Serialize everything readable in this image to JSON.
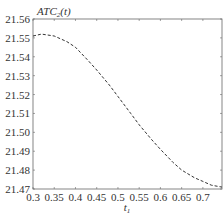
{
  "chart_data": {
    "type": "line",
    "title": "",
    "ylabel": "ATC2(t)",
    "ylabel_main": "ATC",
    "ylabel_sub": "2",
    "ylabel_tail": "(t)",
    "xlabel": "t1",
    "xlabel_main": "t",
    "xlabel_sub": "1",
    "xlim": [
      0.3,
      0.745
    ],
    "ylim": [
      21.47,
      21.56
    ],
    "x_ticks": [
      "0.3",
      "0.35",
      "0.4",
      "0.45",
      "0.5",
      "0.55",
      "0.6",
      "0.65",
      "0.7"
    ],
    "y_ticks": [
      "21.56",
      "21.55",
      "21.54",
      "21.53",
      "21.52",
      "21.51",
      "21.50",
      "21.49",
      "21.48",
      "21.47"
    ],
    "grid": false,
    "line_style": "dashed",
    "series": [
      {
        "name": "ATC2(t)",
        "x": [
          0.3,
          0.32,
          0.35,
          0.38,
          0.4,
          0.43,
          0.45,
          0.48,
          0.5,
          0.53,
          0.55,
          0.58,
          0.6,
          0.63,
          0.65,
          0.68,
          0.7,
          0.72,
          0.745
        ],
        "values": [
          21.551,
          21.552,
          21.551,
          21.548,
          21.545,
          21.538,
          21.533,
          21.525,
          21.519,
          21.51,
          21.504,
          21.496,
          21.491,
          21.484,
          21.48,
          21.476,
          21.474,
          21.472,
          21.471
        ]
      }
    ]
  }
}
